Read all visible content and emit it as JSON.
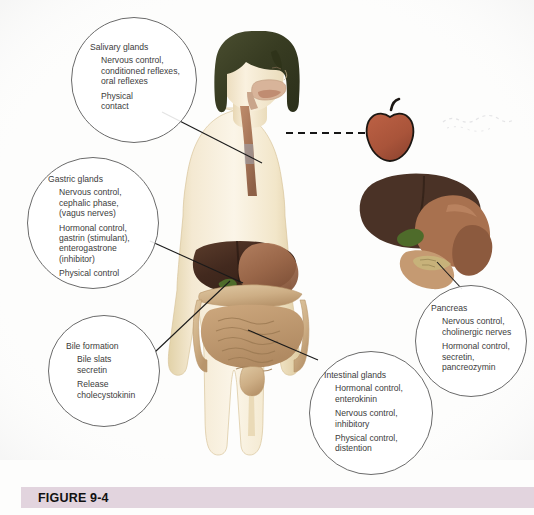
{
  "figure": {
    "caption_label": "FIGURE 9-4",
    "caption_bar_color": "#E2D4DE"
  },
  "colors": {
    "callout_stroke": "#6B6B6B",
    "leader_line": "#1A1A1A",
    "text": "#3C3C3C",
    "apple_body": "#A9543A",
    "apple_outline": "#1C1713",
    "apple_stem": "#1C1713",
    "skin": "#F2E6CB",
    "hair": "#3E4228",
    "liver": "#4A3226",
    "stomach": "#9E6A4C",
    "intestine": "#C19A72",
    "gallbladder": "#4E6B2A",
    "esophagus": "#8C5A42",
    "oral_cavity": "#C9A58B"
  },
  "callouts": [
    {
      "id": "salivary",
      "title": "Salivary glands",
      "groups": [
        [
          "Nervous control,",
          "conditioned reflexes,",
          "oral reflexes"
        ],
        [
          "Physical",
          "contact"
        ]
      ]
    },
    {
      "id": "gastric",
      "title": "Gastric glands",
      "groups": [
        [
          "Nervous control,",
          "cephalic phase,",
          "(vagus nerves)"
        ],
        [
          "Hormonal control,",
          "gastrin (stimulant),",
          "enterogastrone",
          "(inhibitor)"
        ],
        [
          "Physical control"
        ]
      ]
    },
    {
      "id": "bile",
      "title": "Bile formation",
      "groups": [
        [
          "Bile slats",
          "secretin"
        ],
        [
          "Release",
          "cholecystokinin"
        ]
      ]
    },
    {
      "id": "intestinal",
      "title": "Intestinal glands",
      "groups": [
        [
          "Hormonal control,",
          "enterokinin"
        ],
        [
          "Nervous control,",
          "inhibitory"
        ],
        [
          "Physical control,",
          "distention"
        ]
      ]
    },
    {
      "id": "pancreas",
      "title": "Pancreas",
      "groups": [
        [
          "Nervous control,",
          "cholinergic nerves"
        ],
        [
          "Hormonal control,",
          "secretin,",
          "pancreozymin"
        ]
      ]
    }
  ],
  "illustration": {
    "subject": "child-digestive-system-anatomy",
    "inset": "liver-stomach-pancreas-detail",
    "food_item": "apple"
  }
}
